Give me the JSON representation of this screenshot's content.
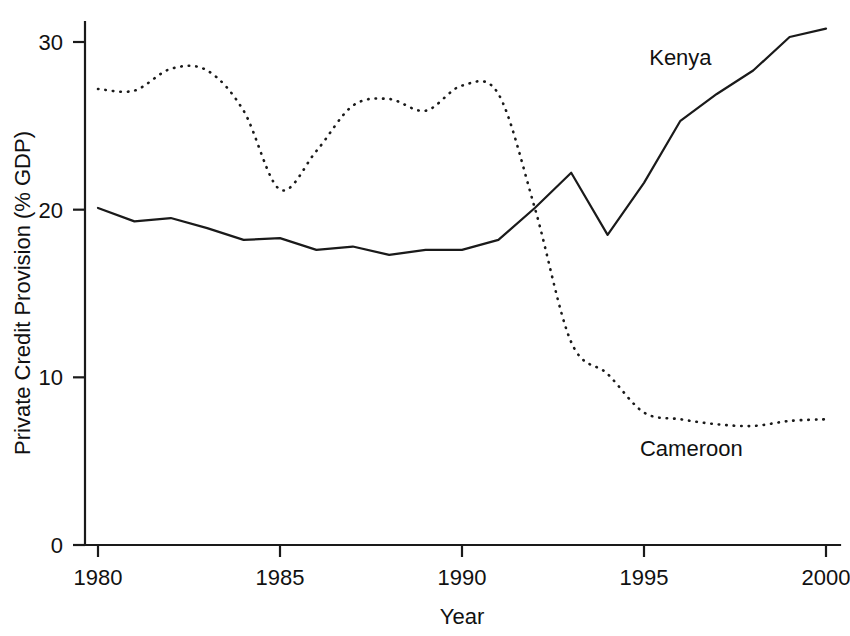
{
  "chart_data": {
    "type": "line",
    "title": "",
    "xlabel": "Year",
    "ylabel": "Private Credit Provision (% GDP)",
    "xlim": [
      1980,
      2000
    ],
    "ylim": [
      0,
      32
    ],
    "xticks": [
      1980,
      1985,
      1990,
      1995,
      2000
    ],
    "xtick_labels": [
      "1980",
      "1985",
      "1990",
      "1995",
      "2000"
    ],
    "yticks": [
      0,
      10,
      20,
      30
    ],
    "ytick_labels": [
      "0",
      "10",
      "20",
      "30"
    ],
    "grid": false,
    "legend": "inline-annotations",
    "x": [
      1980,
      1981,
      1982,
      1983,
      1984,
      1985,
      1986,
      1987,
      1988,
      1989,
      1990,
      1991,
      1992,
      1993,
      1994,
      1995,
      1996,
      1997,
      1998,
      1999,
      2000
    ],
    "series": [
      {
        "name": "Kenya",
        "style": "solid",
        "label_x": 1996.0,
        "label_y": 28.6,
        "values": [
          20.1,
          19.3,
          19.5,
          18.9,
          18.2,
          18.3,
          17.6,
          17.8,
          17.3,
          17.6,
          17.6,
          18.2,
          20.1,
          22.2,
          18.5,
          21.6,
          25.3,
          26.9,
          28.3,
          30.3,
          30.8
        ]
      },
      {
        "name": "Cameroon",
        "style": "dotted",
        "label_x": 1996.3,
        "label_y": 5.3,
        "values": [
          27.2,
          27.1,
          28.4,
          28.3,
          25.9,
          21.2,
          23.5,
          26.2,
          26.6,
          25.9,
          27.4,
          26.9,
          20.1,
          12.1,
          10.2,
          7.9,
          7.5,
          7.2,
          7.1,
          7.4,
          7.5
        ]
      }
    ]
  },
  "axes": {
    "y_title": "Private Credit Provision (% GDP)",
    "x_title": "Year"
  }
}
